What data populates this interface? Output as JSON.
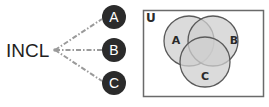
{
  "diagram": {
    "root_label": "INCL",
    "branches": [
      {
        "label": "A"
      },
      {
        "label": "B"
      },
      {
        "label": "C"
      }
    ],
    "venn": {
      "universe_label": "U",
      "sets": [
        {
          "label": "A"
        },
        {
          "label": "B"
        },
        {
          "label": "C"
        }
      ]
    },
    "colors": {
      "badge_fill": "#2b2b2b",
      "connector": "#9a9a9a",
      "circle_fill": "#c8c8c8",
      "circle_stroke": "#5a5a5a",
      "frame_stroke": "#6a6a6a"
    }
  }
}
